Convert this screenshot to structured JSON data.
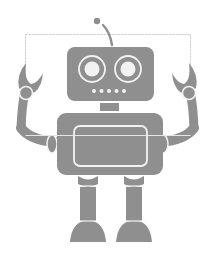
{
  "illustration": {
    "subject": "robot",
    "colors": {
      "body": "#8f8f8f",
      "outline": "#f2f2f2",
      "background": "#ffffff",
      "selection": "#c8c8c8"
    },
    "parts": [
      "antenna",
      "head",
      "eyes",
      "mouth-dots",
      "neck",
      "torso",
      "chest-panel",
      "arms",
      "claws",
      "legs",
      "feet"
    ]
  },
  "selection_box": {
    "visible": true
  }
}
